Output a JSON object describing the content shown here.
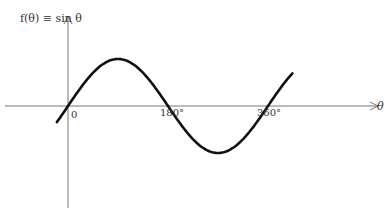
{
  "chart_data": {
    "type": "line",
    "title": "f(θ) ≡ sin θ",
    "xlabel": "θ",
    "ylabel": "f(θ)",
    "x_tick_labels": [
      "0",
      "180°",
      "360°"
    ],
    "x_ticks_deg": [
      0,
      180,
      360
    ],
    "xlim_deg": [
      -40,
      420
    ],
    "ylim": [
      -1.3,
      1.5
    ],
    "series": [
      {
        "name": "sin θ",
        "x_deg": [
          -20,
          0,
          45,
          90,
          135,
          180,
          225,
          270,
          315,
          360,
          405
        ],
        "y": [
          -0.34,
          0,
          0.71,
          1,
          0.71,
          0,
          -0.71,
          -1,
          -0.71,
          0,
          0.71
        ]
      }
    ],
    "grid": false,
    "legend": "none"
  },
  "labels": {
    "title_prefix": "f(θ) ≡ sin θ",
    "tick_0": "0",
    "tick_180": "180°",
    "tick_360": "360°",
    "x_axis": "θ"
  }
}
